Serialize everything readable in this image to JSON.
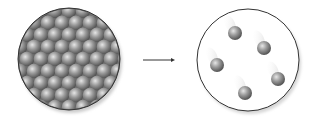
{
  "diagram": {
    "left_panel": {
      "label": "dense-packed-particles",
      "center": [
        69,
        59
      ],
      "radius": 51,
      "rows": 8,
      "spacing": 14
    },
    "arrow": {
      "from": [
        143,
        60
      ],
      "to": [
        174,
        60
      ]
    },
    "right_panel": {
      "label": "dispersed-particles",
      "center": [
        248,
        60
      ],
      "radius": 51,
      "particles": [
        [
          235,
          33
        ],
        [
          264,
          48
        ],
        [
          217,
          65
        ],
        [
          278,
          79
        ],
        [
          245,
          93
        ]
      ]
    },
    "colors": {
      "particle": "#8c8c8c",
      "outline": "#333333",
      "background": "#ffffff"
    }
  }
}
